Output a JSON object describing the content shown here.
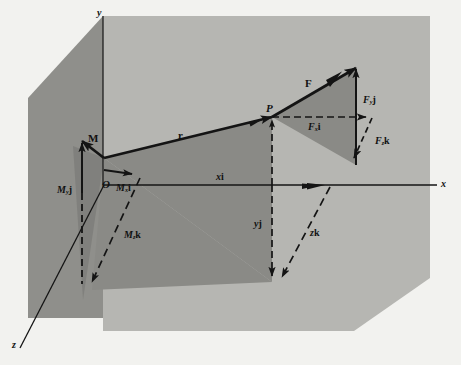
{
  "figure": {
    "background_color": "#f2f2ef",
    "plane_light_color": "#b6b6b2",
    "plane_dark_color": "#8e8e8a",
    "triangle_dark_color": "#8a8a86",
    "line_color": "#141414"
  },
  "axes": {
    "x_label": "x",
    "y_label": "y",
    "z_label": "z"
  },
  "points": {
    "origin_label": "O",
    "point_p_label": "P"
  },
  "vectors": {
    "force": "F",
    "moment": "M",
    "position": "r"
  },
  "force_components": {
    "x": {
      "value": "F",
      "sub": "x",
      "unit": "i"
    },
    "y": {
      "value": "F",
      "sub": "y",
      "unit": "j"
    },
    "z": {
      "value": "F",
      "sub": "z",
      "unit": "k"
    }
  },
  "moment_components": {
    "x": {
      "value": "M",
      "sub": "x",
      "unit": "i"
    },
    "y": {
      "value": "M",
      "sub": "y",
      "unit": "j"
    },
    "z": {
      "value": "M",
      "sub": "z",
      "unit": "k"
    }
  },
  "position_components": {
    "x": {
      "value": "x",
      "unit": "i"
    },
    "y": {
      "value": "y",
      "unit": "j"
    },
    "z": {
      "value": "z",
      "unit": "k"
    }
  }
}
